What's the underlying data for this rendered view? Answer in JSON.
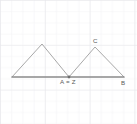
{
  "figure": {
    "width": 137,
    "height": 124,
    "background_color": "#ffffff",
    "grid": {
      "visible": true,
      "spacing_px": 11.2,
      "minor_color": "#f0f0f2",
      "major_color": "#e4e4e8",
      "major_every": 4
    },
    "baseline": {
      "color": "#8a8a8a",
      "stroke_width": 1.4,
      "x1": 12,
      "y1": 77,
      "x2": 124,
      "y2": 77
    },
    "stroke": {
      "color": "#9a9a9a",
      "stroke_width": 0.9
    },
    "points": [
      {
        "id": "left-foot",
        "label": "",
        "x": 12,
        "y": 77,
        "marked": false
      },
      {
        "id": "left-apex",
        "label": "",
        "x": 42,
        "y": 44,
        "marked": false
      },
      {
        "id": "a-z",
        "label": "A = Z",
        "x": 69,
        "y": 77,
        "marked": true
      },
      {
        "id": "c",
        "label": "C",
        "x": 95,
        "y": 47,
        "marked": false
      },
      {
        "id": "b",
        "label": "B",
        "x": 124,
        "y": 77,
        "marked": false
      }
    ],
    "triangles": [
      {
        "id": "left-triangle",
        "vertices": [
          [
            12,
            77
          ],
          [
            42,
            44
          ],
          [
            69,
            77
          ]
        ]
      },
      {
        "id": "right-triangle",
        "vertices": [
          [
            69,
            77
          ],
          [
            95,
            47
          ],
          [
            124,
            77
          ]
        ]
      }
    ],
    "labels": {
      "a_z": "A = Z",
      "c": "C",
      "b": "B"
    },
    "marker": {
      "color": "#6e6e6e",
      "radius": 1.3
    }
  }
}
